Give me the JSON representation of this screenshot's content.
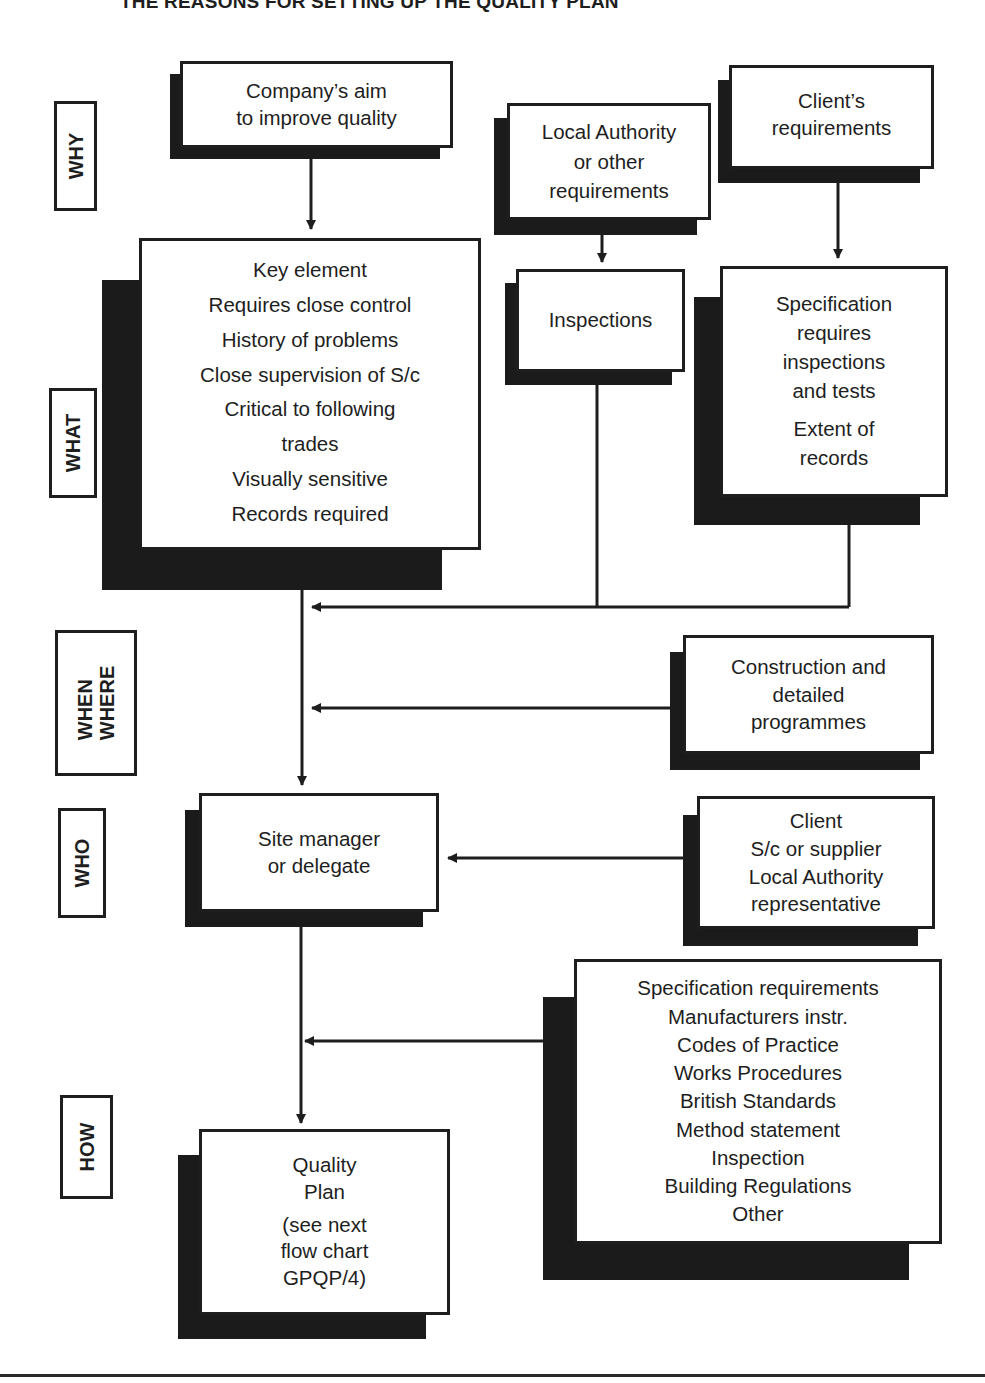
{
  "title": "THE REASONS FOR SETTING UP THE QUALITY PLAN",
  "row_labels": {
    "why": [
      "WHY"
    ],
    "what": [
      "WHAT"
    ],
    "when_where": [
      "WHEN",
      "WHERE"
    ],
    "who": [
      "WHO"
    ],
    "how": [
      "HOW"
    ]
  },
  "boxes": {
    "company_aim": [
      "Company’s aim",
      "to improve quality"
    ],
    "local_authority": [
      "Local Authority",
      "or other",
      "requirements"
    ],
    "clients_requirements": [
      "Client’s",
      "requirements"
    ],
    "what_criteria": [
      "Key element",
      "Requires close control",
      "History of problems",
      "Close supervision of S/c",
      "Critical to following",
      "trades",
      "Visually sensitive",
      "Records required"
    ],
    "inspections": [
      "Inspections"
    ],
    "specification": [
      "Specification",
      "requires",
      "inspections",
      "and tests",
      "",
      "Extent of",
      "records"
    ],
    "programmes": [
      "Construction and",
      "detailed",
      "programmes"
    ],
    "site_manager": [
      "Site manager",
      "or delegate"
    ],
    "who_others": [
      "Client",
      "S/c or supplier",
      "Local Authority",
      "representative"
    ],
    "how_sources": [
      "Specification requirements",
      "Manufacturers instr.",
      "Codes of Practice",
      "Works Procedures",
      "British Standards",
      "Method statement",
      "Inspection",
      "Building Regulations",
      "Other"
    ],
    "quality_plan": [
      "Quality",
      "Plan",
      "(see next",
      "flow chart",
      "GPQP/4)"
    ]
  },
  "colors": {
    "ink": "#1e1e1e",
    "shadow": "#1b1b1b",
    "background": "#ffffff"
  }
}
